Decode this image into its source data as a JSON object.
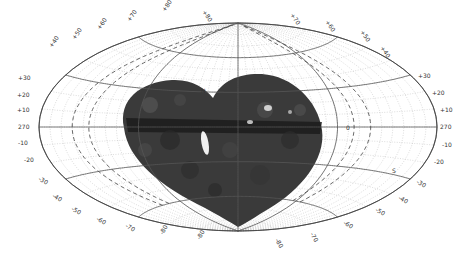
{
  "figure": {
    "projection": "aitoff",
    "colors": {
      "background": "#ffffff",
      "major_grid": "#555555",
      "minor_grid": "#b8b8b8",
      "dashed_curves": "#444444",
      "data_region": "#3a3a3a",
      "data_region_dark": "#1a1a1a",
      "bright_feature": "#f0f0f0"
    },
    "equator_labels": {
      "left": "270",
      "right": "270",
      "center_marker": "0"
    },
    "pole_markers": {
      "north": "N",
      "south": "S"
    },
    "left_lat_labels": [
      "+30",
      "+20",
      "+10",
      "-10",
      "-20",
      "-30",
      "-40",
      "-50",
      "-60",
      "-70"
    ],
    "right_lat_labels": [
      "+30",
      "+20",
      "+10",
      "-10",
      "-20",
      "-30",
      "-40",
      "-50",
      "-60"
    ],
    "upper_rim_labels": [
      "+40",
      "+50",
      "+60",
      "+70",
      "+80",
      "+80",
      "+70",
      "+60",
      "+50",
      "+40"
    ],
    "lower_rim_labels": [
      "-80",
      "-80",
      "-80",
      "-70"
    ],
    "major_latitudes_deg": [
      -60,
      -30,
      0,
      30,
      60
    ],
    "major_longitudes_deg": [
      -180,
      -90,
      0,
      90,
      180
    ],
    "minor_step_deg": 10
  }
}
